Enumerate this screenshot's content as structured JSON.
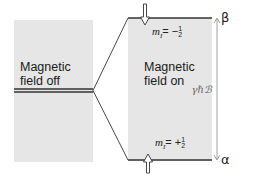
{
  "diagram": {
    "left_panel": {
      "label_line1": "Magnetic",
      "label_line2": "field off"
    },
    "right_panel": {
      "label_line1": "Magnetic",
      "label_line2": "field on"
    },
    "upper_level": {
      "m_label": "m",
      "m_subscript": "I",
      "m_value_sign": "= −",
      "fraction_num": "1",
      "fraction_den": "2",
      "state": "β",
      "spin_arrow": "down"
    },
    "lower_level": {
      "m_label": "m",
      "m_subscript": "I",
      "m_value_sign": "= +",
      "fraction_num": "1",
      "fraction_den": "2",
      "state": "α",
      "spin_arrow": "up"
    },
    "energy_gap_label": "γℏℬ",
    "colors": {
      "panel": "#e6e6e6",
      "lines": "#333333",
      "gap_arrow": "#888888"
    }
  }
}
